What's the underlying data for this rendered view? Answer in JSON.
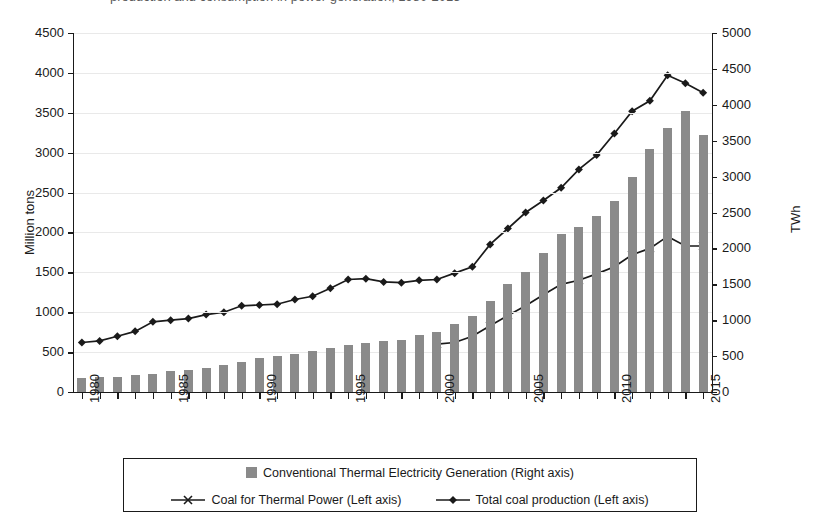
{
  "top_cut_text": "production and consumption in power generation, 1980-2015",
  "axes": {
    "left_title": "Million tons",
    "right_title": "TWh",
    "left_ticks": [
      "0",
      "500",
      "1000",
      "1500",
      "2000",
      "2500",
      "3000",
      "3500",
      "4000",
      "4500"
    ],
    "right_ticks": [
      "0",
      "500",
      "1000",
      "1500",
      "2000",
      "2500",
      "3000",
      "3500",
      "4000",
      "4500",
      "5000"
    ],
    "x_ticks": [
      "1980",
      "1985",
      "1990",
      "1995",
      "2000",
      "2005",
      "2010",
      "2015"
    ]
  },
  "legend": {
    "items": [
      {
        "label": "Conventional Thermal Electricity Generation (Right axis)",
        "marker": "bar-swatch"
      },
      {
        "label": "Coal for Thermal Power (Left axis)",
        "marker": "line-cross"
      },
      {
        "label": "Total coal production  (Left axis)",
        "marker": "line-diamond"
      }
    ]
  },
  "colors": {
    "bar": "#8a8a8a",
    "line": "#1a1a1a",
    "grid": "#e9e9e9",
    "axis": "#1a1a1a"
  },
  "chart_data": {
    "type": "bar",
    "title": "",
    "xlabel": "",
    "ylabel": "Million tons",
    "y2label": "TWh",
    "ylim": [
      0,
      4500
    ],
    "y2lim": [
      0,
      5000
    ],
    "grid": true,
    "legend_position": "bottom",
    "categories": [
      1980,
      1981,
      1982,
      1983,
      1984,
      1985,
      1986,
      1987,
      1988,
      1989,
      1990,
      1991,
      1992,
      1993,
      1994,
      1995,
      1996,
      1997,
      1998,
      1999,
      2000,
      2001,
      2002,
      2003,
      2004,
      2005,
      2006,
      2007,
      2008,
      2009,
      2010,
      2011,
      2012,
      2013,
      2014,
      2015
    ],
    "series": [
      {
        "name": "Conventional Thermal Electricity Generation (Right axis)",
        "axis": "right",
        "type": "bar",
        "unit": "TWh",
        "values": [
          200,
          205,
          215,
          235,
          255,
          290,
          310,
          335,
          375,
          415,
          470,
          495,
          530,
          565,
          610,
          655,
          680,
          710,
          720,
          790,
          830,
          950,
          1060,
          1270,
          1500,
          1670,
          1930,
          2200,
          2300,
          2450,
          2660,
          3000,
          3390,
          3680,
          3910,
          3580
        ]
      },
      {
        "name": "Coal for Thermal Power (Left axis)",
        "axis": "left",
        "type": "line",
        "marker": "cross",
        "unit": "Million tons",
        "values": [
          null,
          null,
          null,
          null,
          null,
          null,
          null,
          null,
          null,
          null,
          null,
          null,
          null,
          null,
          null,
          null,
          null,
          null,
          null,
          null,
          600,
          620,
          700,
          830,
          960,
          1080,
          1220,
          1350,
          1400,
          1480,
          1570,
          1720,
          1800,
          1950,
          1830,
          1830
        ]
      },
      {
        "name": "Total coal production  (Left axis)",
        "axis": "left",
        "type": "line",
        "marker": "diamond",
        "unit": "Million tons",
        "values": [
          620,
          640,
          700,
          760,
          880,
          900,
          920,
          970,
          1000,
          1080,
          1090,
          1100,
          1160,
          1200,
          1300,
          1410,
          1420,
          1380,
          1370,
          1400,
          1410,
          1490,
          1570,
          1850,
          2050,
          2250,
          2400,
          2560,
          2790,
          2970,
          3240,
          3520,
          3650,
          3970,
          3870,
          3750
        ]
      }
    ]
  }
}
